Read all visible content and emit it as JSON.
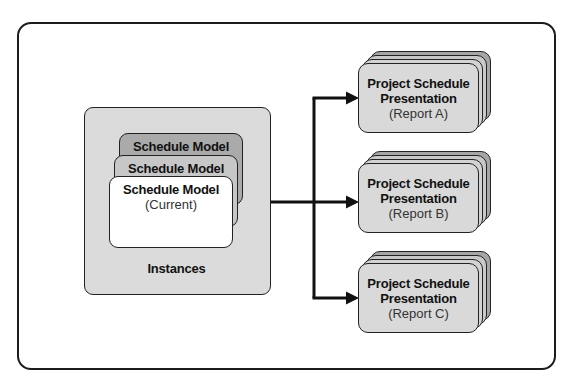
{
  "diagram": {
    "instances": {
      "label": "Instances",
      "cards": [
        {
          "title": "Schedule Model"
        },
        {
          "title": "Schedule Model"
        },
        {
          "title": "Schedule Model",
          "subtitle": "(Current)"
        }
      ]
    },
    "reports": [
      {
        "line1": "Project Schedule",
        "line2": "Presentation",
        "subtitle": "(Report A)"
      },
      {
        "line1": "Project Schedule",
        "line2": "Presentation",
        "subtitle": "(Report B)"
      },
      {
        "line1": "Project Schedule",
        "line2": "Presentation",
        "subtitle": "(Report C)"
      }
    ],
    "colors": {
      "frame_border": "#1c1c1c",
      "instances_box_fill": "#dbdbdb",
      "card_back_fill": "#aaaaaa",
      "card_middle_fill": "#c7c7c7",
      "card_front_fill": "#ffffff",
      "report_card_fill": "#d9d9d9",
      "arrow": "#111111"
    }
  }
}
